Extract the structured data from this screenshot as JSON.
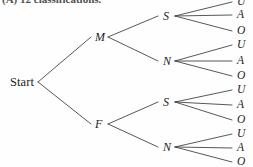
{
  "figure": {
    "caption": "(A) 12 classifications.",
    "type": "probability-tree-diagram",
    "ink_color": "#1c1c1c",
    "background_color": "#fefefe",
    "width": 253,
    "height": 167
  },
  "tree": {
    "root": {
      "label": "Start",
      "x": 10,
      "y": 82,
      "anchor_x": 38,
      "anchor_y": 82
    },
    "level1": [
      {
        "label": "M",
        "x": 95,
        "y": 37,
        "in_x": 91,
        "out_x": 108
      },
      {
        "label": "F",
        "x": 95,
        "y": 124,
        "in_x": 91,
        "out_x": 108
      }
    ],
    "level2": [
      {
        "label": "S",
        "parent": "M",
        "x": 163,
        "y": 16,
        "in_x": 158,
        "out_x": 175
      },
      {
        "label": "N",
        "parent": "M",
        "x": 163,
        "y": 61,
        "in_x": 158,
        "out_x": 175
      },
      {
        "label": "S",
        "parent": "F",
        "x": 163,
        "y": 102,
        "in_x": 158,
        "out_x": 175
      },
      {
        "label": "N",
        "parent": "F",
        "x": 163,
        "y": 147,
        "in_x": 158,
        "out_x": 175
      }
    ],
    "leaves": [
      {
        "label": "U",
        "group": 1,
        "path": "M-S-U",
        "x": 237,
        "y": 2,
        "line_x": 232
      },
      {
        "label": "A",
        "group": 1,
        "path": "M-S-A",
        "x": 237,
        "y": 15,
        "line_x": 232
      },
      {
        "label": "O",
        "group": 1,
        "path": "M-S-O",
        "x": 237,
        "y": 31,
        "line_x": 232
      },
      {
        "label": "U",
        "group": 2,
        "path": "M-N-U",
        "x": 237,
        "y": 45,
        "line_x": 232
      },
      {
        "label": "A",
        "group": 2,
        "path": "M-N-A",
        "x": 237,
        "y": 61,
        "line_x": 232
      },
      {
        "label": "O",
        "group": 2,
        "path": "M-N-O",
        "x": 237,
        "y": 76,
        "line_x": 232
      },
      {
        "label": "U",
        "group": 3,
        "path": "F-S-U",
        "x": 237,
        "y": 90,
        "line_x": 232
      },
      {
        "label": "A",
        "group": 3,
        "path": "F-S-A",
        "x": 237,
        "y": 105,
        "line_x": 232
      },
      {
        "label": "O",
        "group": 3,
        "path": "F-S-O",
        "x": 237,
        "y": 120,
        "line_x": 232
      },
      {
        "label": "U",
        "group": 4,
        "path": "F-N-U",
        "x": 237,
        "y": 134,
        "line_x": 232
      },
      {
        "label": "A",
        "group": 4,
        "path": "F-N-A",
        "x": 237,
        "y": 148,
        "line_x": 232
      },
      {
        "label": "O",
        "group": 4,
        "path": "F-N-O",
        "x": 237,
        "y": 162,
        "line_x": 232
      }
    ],
    "total_outcomes": 12
  }
}
